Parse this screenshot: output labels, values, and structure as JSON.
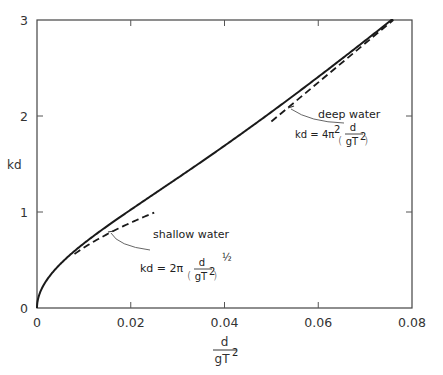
{
  "chart_data": {
    "type": "line",
    "title": "",
    "xlabel": "d / gT²",
    "ylabel": "kd",
    "xlim": [
      0,
      0.08
    ],
    "ylim": [
      0,
      3
    ],
    "grid": false,
    "x_ticks": [
      "0",
      "0.02",
      "0.04",
      "0.06",
      "0.08"
    ],
    "y_ticks": [
      "0",
      "1",
      "2",
      "3"
    ],
    "series": [
      {
        "name": "exact dispersion relation",
        "style": "solid",
        "relation": "kd·tanh(kd) = 4π² d/(gT²)",
        "x": [
          0,
          0.002,
          0.005,
          0.01,
          0.015,
          0.02,
          0.03,
          0.04,
          0.05,
          0.06,
          0.07,
          0.076
        ],
        "y": [
          0,
          0.28,
          0.45,
          0.65,
          0.81,
          0.95,
          1.22,
          1.48,
          1.76,
          2.02,
          2.55,
          3.0
        ]
      },
      {
        "name": "shallow water",
        "style": "dashed",
        "formula": "kd = 2π (d/gT²)^½",
        "x": [
          0.008,
          0.025
        ],
        "y": [
          0.56,
          0.99
        ]
      },
      {
        "name": "deep water",
        "style": "dashed",
        "formula": "kd = 4π² (d/gT²)",
        "x": [
          0.05,
          0.076
        ],
        "y": [
          1.97,
          3.0
        ]
      }
    ],
    "annotations": [
      {
        "text": "shallow water",
        "formula": "kd = 2π(d/gT²)^½"
      },
      {
        "text": "deep water",
        "formula": "kd = 4π²(d/gT²)"
      }
    ]
  },
  "axes": {
    "x_label_num": "d",
    "x_label_den": "gT",
    "x_label_exp": "2",
    "y_label": "kd"
  },
  "annotations": {
    "shallow": {
      "title": "shallow water",
      "lhs": "kd = 2π",
      "num": "d",
      "den": "gT",
      "den_exp": "2",
      "power": "½"
    },
    "deep": {
      "title": "deep water",
      "lhs": "kd = 4π",
      "lhs_exp": "2",
      "num": "d",
      "den": "gT",
      "den_exp": "2"
    }
  },
  "colors": {
    "line": "#1a1a1a",
    "axis": "#444444",
    "text": "#333333"
  }
}
